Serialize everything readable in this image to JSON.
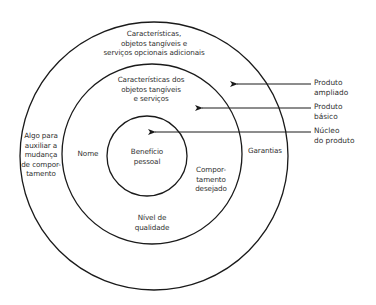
{
  "diagram": {
    "type": "concentric-circles",
    "rings": [
      {
        "id": "outer",
        "name": "Produto ampliado",
        "cx": 154,
        "cy": 156,
        "r": 134
      },
      {
        "id": "middle",
        "name": "Produto básico",
        "cx": 152,
        "cy": 154,
        "r": 90
      },
      {
        "id": "inner",
        "name": "Núcleo do produto",
        "cx": 147,
        "cy": 156,
        "r": 40
      }
    ],
    "stroke_color": "#1a1a1a",
    "labels": {
      "outer_top": "Características,\nobjetos tangíveis e\nserviços opcionais adicionais",
      "outer_left": "Algo para\nauxiliar a\nmudança\nde compor-\ntamento",
      "outer_right": "Garantias",
      "middle_top": "Características dos\nobjetos tangíveis\ne serviços",
      "middle_left": "Nome",
      "middle_right": "Compor-\ntamento\ndesejado",
      "middle_bottom": "Nível de\nqualidade",
      "inner_center": "Benefício\npessoal"
    },
    "legend": [
      {
        "label": "Produto\nampliado",
        "arrow_tip": [
          235,
          84
        ]
      },
      {
        "label": "Produto\nbásico",
        "arrow_tip": [
          200,
          108
        ]
      },
      {
        "label": "Núcleo\ndo produto",
        "arrow_tip": [
          153,
          132
        ]
      }
    ]
  }
}
